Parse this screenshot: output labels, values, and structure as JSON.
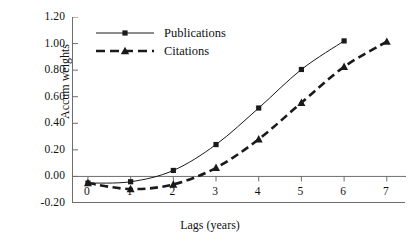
{
  "chart_data": {
    "type": "line",
    "title": "",
    "xlabel": "Lags (years)",
    "ylabel": "Accum weights",
    "x": [
      0,
      1,
      2,
      3,
      4,
      5,
      6,
      7
    ],
    "xticklabels": [
      "0",
      "1",
      "2",
      "3",
      "4",
      "5",
      "6",
      "7"
    ],
    "yticklabels": [
      "1.20",
      "1.00",
      "0.80",
      "0.60",
      "0.40",
      "0.20",
      "0.00",
      "-0.20"
    ],
    "yticks": [
      1.2,
      1.0,
      0.8,
      0.6,
      0.4,
      0.2,
      0.0,
      -0.2
    ],
    "xlim": [
      -0.35,
      7.45
    ],
    "ylim": [
      -0.2,
      1.2
    ],
    "grid": false,
    "legend_position": "upper left",
    "series": [
      {
        "name": "Publications",
        "marker": "square",
        "linestyle": "solid",
        "color": "#1a1a1a",
        "x": [
          0,
          1,
          2,
          3,
          4,
          5,
          6
        ],
        "values": [
          -0.05,
          -0.04,
          0.045,
          0.24,
          0.515,
          0.805,
          1.02
        ]
      },
      {
        "name": "Citations",
        "marker": "triangle",
        "linestyle": "dashed",
        "color": "#1a1a1a",
        "x": [
          0,
          1,
          2,
          3,
          4,
          5,
          6,
          7
        ],
        "values": [
          -0.05,
          -0.095,
          -0.06,
          0.065,
          0.28,
          0.555,
          0.825,
          1.015
        ]
      }
    ]
  },
  "legend": {
    "items": [
      {
        "label": "Publications",
        "marker": "square-marker",
        "linestyle": "solid"
      },
      {
        "label": "Citations",
        "marker": "triangle-marker",
        "linestyle": "dashed"
      }
    ]
  },
  "axes": {
    "y_title": "Accum weights",
    "x_title": "Lags (years)"
  },
  "colors": {
    "ink": "#1a1a1a",
    "axis": "#6e6e6e",
    "background": "#ffffff"
  }
}
